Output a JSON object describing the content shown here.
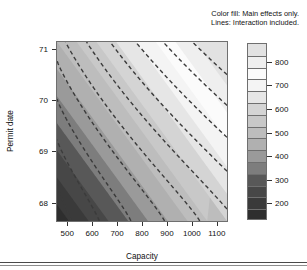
{
  "caption": {
    "line1": "Color fill: Main effects only.",
    "line2": "Lines: Interaction included."
  },
  "chart_data": {
    "type": "heatmap",
    "subtype": "filled-contour-with-overlaid-contour-lines",
    "title": "",
    "subtitle": "Color fill: Main effects only. Lines: Interaction included.",
    "xlabel": "Capacity",
    "ylabel": "Permit date",
    "xlim": [
      455,
      1145
    ],
    "ylim": [
      67.62,
      71.15
    ],
    "xticks": [
      500,
      600,
      700,
      800,
      900,
      1000,
      1100
    ],
    "xticklabels": [
      "500",
      "600",
      "700",
      "800",
      "900",
      "1000",
      "1100"
    ],
    "yticks": [
      68,
      69,
      70,
      71
    ],
    "yticklabels": [
      "68",
      "69",
      "70",
      "71"
    ],
    "grid": false,
    "colorbar": {
      "position": "right",
      "orientation": "vertical",
      "vmin": 130,
      "vmax": 880,
      "ticks": [
        200,
        300,
        400,
        500,
        600,
        700,
        800
      ],
      "ticklabels": [
        "200",
        "300",
        "400",
        "500",
        "600",
        "700",
        "800"
      ],
      "colormap": "grayscale-terrain",
      "levels": [
        130,
        180,
        230,
        280,
        330,
        380,
        430,
        480,
        530,
        580,
        630,
        680,
        730,
        780,
        830,
        880
      ],
      "level_colors": [
        "#2e2e2e",
        "#3a3a3a",
        "#474747",
        "#585858",
        "#7d7d7d",
        "#9a9a9a",
        "#b0b0b0",
        "#bdbdbd",
        "#c8c8c8",
        "#d4d4d4",
        "#e6e6e6",
        "#f4f4f4",
        "#fbfbfb",
        "#efefef",
        "#e2e2e2"
      ]
    },
    "fill_model": {
      "name": "Main effects only",
      "description": "Additive response surface; fill value increases with Capacity and with Permit date",
      "formula": "z = 130 + 0.62*(Capacity-455) + 95*(PermitDate-67.62)",
      "z_corners": {
        "bottom_left": 150,
        "bottom_right": 580,
        "top_left": 480,
        "top_right": 900
      }
    },
    "line_model": {
      "name": "Interaction included",
      "description": "Dashed contour lines of the interaction model; curved, sloping down-right",
      "style": "dashed",
      "color": "#3b3b3b",
      "linewidth": 1.4,
      "dasharray": "4 3",
      "n_lines": 10,
      "levels": [
        200,
        280,
        360,
        440,
        520,
        600,
        680,
        760,
        840,
        920
      ]
    },
    "series": [
      {
        "name": "fill-bands",
        "values": [
          130,
          180,
          230,
          280,
          330,
          380,
          430,
          480,
          530,
          580,
          630,
          680,
          730,
          780,
          830,
          880
        ]
      }
    ]
  },
  "axes": {
    "x": {
      "label": "Capacity",
      "ticks": [
        {
          "value": 500,
          "label": "500"
        },
        {
          "value": 600,
          "label": "600"
        },
        {
          "value": 700,
          "label": "700"
        },
        {
          "value": 800,
          "label": "800"
        },
        {
          "value": 900,
          "label": "900"
        },
        {
          "value": 1000,
          "label": "1000"
        },
        {
          "value": 1100,
          "label": "1100"
        }
      ]
    },
    "y": {
      "label": "Permit date",
      "ticks": [
        {
          "value": 71,
          "label": "71"
        },
        {
          "value": 70,
          "label": "70"
        },
        {
          "value": 69,
          "label": "69"
        },
        {
          "value": 68,
          "label": "68"
        }
      ]
    }
  },
  "legend": {
    "ticks": [
      {
        "value": 800,
        "label": "800"
      },
      {
        "value": 700,
        "label": "700"
      },
      {
        "value": 600,
        "label": "600"
      },
      {
        "value": 500,
        "label": "500"
      },
      {
        "value": 400,
        "label": "400"
      },
      {
        "value": 300,
        "label": "300"
      },
      {
        "value": 200,
        "label": "200"
      }
    ]
  },
  "colors": {
    "frame": "#6f6f6f",
    "text": "#111111",
    "contour_line": "#3b3b3b",
    "rule": "#4a4a4a"
  }
}
